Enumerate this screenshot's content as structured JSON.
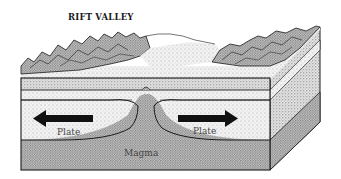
{
  "diagram": {
    "title": "RIFT VALLEY",
    "labels": {
      "plate_left": "Plate",
      "plate_right": "Plate",
      "magma": "Magma"
    },
    "arrows": [
      {
        "name": "left-plate-arrow",
        "direction": "left"
      },
      {
        "name": "right-plate-arrow",
        "direction": "right"
      }
    ],
    "layers": [
      "surface mountains",
      "crust",
      "plate",
      "magma"
    ],
    "colors": {
      "ink": "#1a1a1a",
      "stipple_light": "#e6e6e6",
      "stipple_mid": "#cfcfcf",
      "stipple_dark": "#a8a8a8",
      "background": "#ffffff"
    }
  }
}
